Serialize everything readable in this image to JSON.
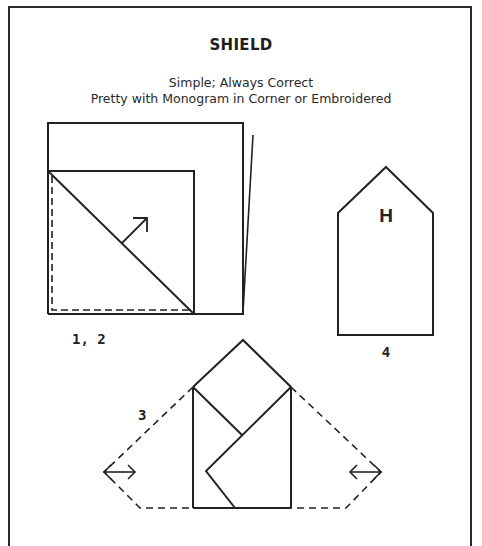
{
  "page": {
    "title": "SHIELD",
    "subtitle_lines": [
      "Simple; Always Correct",
      "Pretty with Monogram in Corner or Embroidered"
    ]
  },
  "figures": {
    "step_1_2": {
      "label": "1, 2"
    },
    "step_3": {
      "label": "3"
    },
    "step_4": {
      "label": "4",
      "monogram": "H"
    }
  },
  "colors": {
    "ink": "#222222",
    "paper": "#ffffff"
  }
}
